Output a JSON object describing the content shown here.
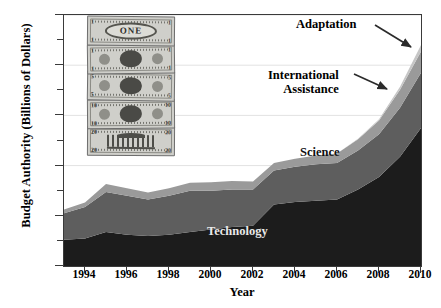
{
  "chart_data": {
    "type": "area",
    "stacked": true,
    "title": "",
    "xlabel": "Year",
    "ylabel": "Budget Authority (Billions of Dollars)",
    "xlim": [
      1993,
      2010
    ],
    "ylim": [
      0,
      10
    ],
    "x": [
      1993,
      1994,
      1995,
      1996,
      1997,
      1998,
      1999,
      2000,
      2001,
      2002,
      2003,
      2004,
      2005,
      2006,
      2007,
      2008,
      2009,
      2010
    ],
    "xticks": [
      1994,
      1996,
      1998,
      2000,
      2002,
      2004,
      2006,
      2008,
      2010
    ],
    "xticklabels": [
      "1994",
      "1996",
      "1998",
      "2000",
      "2002",
      "2004",
      "2006",
      "2008",
      "2010"
    ],
    "yticks": [
      0,
      2.0,
      4.0,
      6.0,
      8.0,
      10.0
    ],
    "yticklabels": [
      "$0",
      "$2.0",
      "$4.0",
      "$6.0",
      "$8.0",
      "$10.0"
    ],
    "yminorticks": [
      1.0,
      3.0,
      5.0,
      7.0,
      9.0
    ],
    "grid": "horizontal-major",
    "legend": "inline-labels-and-callouts",
    "series": [
      {
        "name": "Technology",
        "color": "#1c1c1c",
        "label_kind": "inline",
        "values": [
          1.05,
          1.1,
          1.35,
          1.25,
          1.2,
          1.25,
          1.35,
          1.45,
          1.55,
          1.6,
          2.45,
          2.55,
          2.6,
          2.65,
          3.05,
          3.55,
          4.35,
          5.5
        ]
      },
      {
        "name": "Science",
        "color": "#5e5e5e",
        "label_kind": "inline",
        "values": [
          1.05,
          1.25,
          1.6,
          1.55,
          1.45,
          1.55,
          1.65,
          1.55,
          1.5,
          1.45,
          1.35,
          1.4,
          1.45,
          1.45,
          1.55,
          1.7,
          1.95,
          2.2
        ]
      },
      {
        "name": "International Assistance",
        "color": "#9a9a9a",
        "label_kind": "callout",
        "values": [
          0.15,
          0.18,
          0.32,
          0.3,
          0.28,
          0.3,
          0.32,
          0.34,
          0.34,
          0.32,
          0.3,
          0.32,
          0.35,
          0.38,
          0.45,
          0.55,
          0.72,
          0.85
        ]
      },
      {
        "name": "Adaptation",
        "color": "#c6c6c6",
        "label_kind": "callout",
        "values": [
          0.0,
          0.0,
          0.0,
          0.0,
          0.0,
          0.0,
          0.0,
          0.0,
          0.0,
          0.0,
          0.0,
          0.0,
          0.0,
          0.0,
          0.02,
          0.05,
          0.12,
          0.25
        ]
      }
    ],
    "totals": [
      2.25,
      2.53,
      3.27,
      3.1,
      2.93,
      3.1,
      3.32,
      3.34,
      3.39,
      3.37,
      4.1,
      4.27,
      4.4,
      4.48,
      5.07,
      5.85,
      7.14,
      8.8
    ],
    "annotations": [
      {
        "text": "Adaptation",
        "target_year": 2010,
        "target_value": 8.7
      },
      {
        "text": "International\nAssistance",
        "text_line1": "International",
        "text_line2": "Assistance",
        "target_year": 2009,
        "target_value": 6.6
      }
    ],
    "decoration": {
      "name": "stack-of-us-banknotes",
      "count": 5,
      "bills": [
        {
          "denomination": "1",
          "center_text": "ONE"
        },
        {
          "denomination": "1",
          "center_text": ""
        },
        {
          "denomination": "5",
          "center_text": ""
        },
        {
          "denomination": "10",
          "center_text": ""
        },
        {
          "denomination": "20",
          "center_text": ""
        }
      ]
    }
  },
  "axes": {
    "ylabel": "Budget Authority (Billions of Dollars)",
    "xlabel": "Year"
  },
  "labels": {
    "science": "Science",
    "technology": "Technology",
    "adaptation": "Adaptation",
    "international": "International",
    "assistance": "Assistance"
  },
  "colors": {
    "technology": "#1c1c1c",
    "science": "#5e5e5e",
    "international_assistance": "#9a9a9a",
    "adaptation": "#c6c6c6",
    "axis": "#3a3a3a",
    "grid": "#e2e2e2",
    "background": "#ffffff"
  }
}
